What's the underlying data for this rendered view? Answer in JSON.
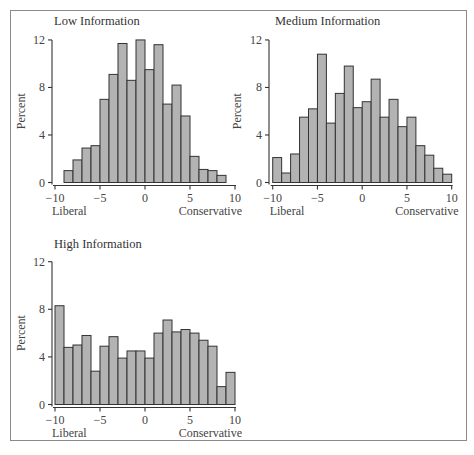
{
  "figure": {
    "panels": [
      {
        "title": "Low Information"
      },
      {
        "title": "Medium Information"
      },
      {
        "title": "High Information"
      }
    ],
    "ylabel": "Percent",
    "x_left_label": "Liberal",
    "x_right_label": "Conservative",
    "yticks": [
      "0",
      "4",
      "8",
      "12"
    ],
    "xticks": [
      "−10",
      "−5",
      "0",
      "5",
      "10"
    ]
  },
  "chart_data": [
    {
      "type": "bar",
      "title": "Low Information",
      "xlabel": "Liberal — Conservative",
      "ylabel": "Percent",
      "xlim": [
        -10,
        10
      ],
      "ylim": [
        0,
        12
      ],
      "bin_width": 1,
      "bin_starts": [
        -9,
        -8,
        -7,
        -6,
        -5,
        -4,
        -3,
        -2,
        -1,
        0,
        1,
        2,
        3,
        4,
        5,
        6,
        7,
        8
      ],
      "values": [
        1.0,
        1.9,
        2.9,
        3.1,
        7.0,
        9.1,
        11.7,
        8.6,
        12.0,
        9.5,
        11.6,
        6.6,
        8.2,
        5.6,
        2.2,
        1.1,
        1.0,
        0.6
      ],
      "xticks": [
        -10,
        -5,
        0,
        5,
        10
      ],
      "yticks": [
        0,
        4,
        8,
        12
      ],
      "grid": false
    },
    {
      "type": "bar",
      "title": "Medium Information",
      "xlabel": "Liberal — Conservative",
      "ylabel": "Percent",
      "xlim": [
        -10,
        10
      ],
      "ylim": [
        0,
        12
      ],
      "bin_width": 1,
      "bin_starts": [
        -10,
        -9,
        -8,
        -7,
        -6,
        -5,
        -4,
        -3,
        -2,
        -1,
        0,
        1,
        2,
        3,
        4,
        5,
        6,
        7,
        8,
        9
      ],
      "values": [
        2.1,
        0.8,
        2.4,
        5.5,
        6.2,
        10.8,
        5.0,
        7.5,
        9.8,
        6.3,
        6.8,
        8.7,
        5.5,
        7.0,
        4.7,
        5.5,
        3.1,
        2.3,
        1.2,
        0.7
      ],
      "xticks": [
        -10,
        -5,
        0,
        5,
        10
      ],
      "yticks": [
        0,
        4,
        8,
        12
      ],
      "grid": false
    },
    {
      "type": "bar",
      "title": "High Information",
      "xlabel": "Liberal — Conservative",
      "ylabel": "Percent",
      "xlim": [
        -10,
        10
      ],
      "ylim": [
        0,
        12
      ],
      "bin_width": 1,
      "bin_starts": [
        -10,
        -9,
        -8,
        -7,
        -6,
        -5,
        -4,
        -3,
        -2,
        -1,
        0,
        1,
        2,
        3,
        4,
        5,
        6,
        7,
        8,
        9
      ],
      "values": [
        8.3,
        4.8,
        5.0,
        5.8,
        2.8,
        4.9,
        5.7,
        3.9,
        4.5,
        4.5,
        3.9,
        6.0,
        7.1,
        6.1,
        6.3,
        6.0,
        5.4,
        4.9,
        1.5,
        2.7
      ],
      "xticks": [
        -10,
        -5,
        0,
        5,
        10
      ],
      "yticks": [
        0,
        4,
        8,
        12
      ],
      "grid": false
    }
  ]
}
